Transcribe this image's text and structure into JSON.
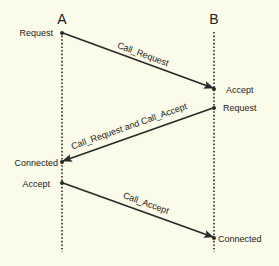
{
  "diagram": {
    "type": "sequence",
    "background": "#fbfbe9",
    "line_color": "#2a2a2a",
    "lifelines": [
      {
        "id": "A",
        "label": "A"
      },
      {
        "id": "B",
        "label": "B"
      }
    ],
    "events": {
      "a_request": "Request",
      "b_accept": "Accept",
      "b_request": "Request",
      "a_connected": "Connected",
      "a_accept": "Accept",
      "b_connected": "Connected"
    },
    "messages": [
      {
        "from": "A",
        "to": "B",
        "label": "Call_Request"
      },
      {
        "from": "B",
        "to": "A",
        "label": "Call_Request and Call_Accept"
      },
      {
        "from": "A",
        "to": "B",
        "label": "Call_Accept"
      }
    ]
  }
}
